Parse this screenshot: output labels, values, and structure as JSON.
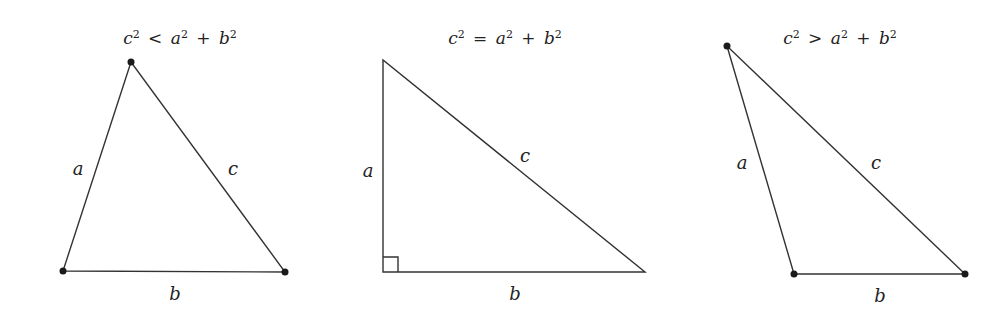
{
  "colors": {
    "stroke": "#333333",
    "text": "#222222",
    "background": "#ffffff"
  },
  "panels": [
    {
      "id": "acute",
      "title": {
        "lhs": "c",
        "op": "<",
        "t1": "a",
        "plus": "+",
        "t2": "b",
        "exp": "2"
      },
      "title_text": "c² < a² + b²",
      "labels": {
        "a": "a",
        "b": "b",
        "c": "c"
      },
      "vertices": [
        [
          63,
          271
        ],
        [
          131,
          62
        ],
        [
          285,
          272
        ]
      ],
      "vertex_dots": true,
      "right_angle_marker": false
    },
    {
      "id": "right",
      "title": {
        "lhs": "c",
        "op": "=",
        "t1": "a",
        "plus": "+",
        "t2": "b",
        "exp": "2"
      },
      "title_text": "c² = a² + b²",
      "labels": {
        "a": "a",
        "b": "b",
        "c": "c"
      },
      "vertices": [
        [
          383,
          272
        ],
        [
          383,
          60
        ],
        [
          645,
          272
        ]
      ],
      "vertex_dots": false,
      "right_angle_marker": true
    },
    {
      "id": "obtuse",
      "title": {
        "lhs": "c",
        "op": ">",
        "t1": "a",
        "plus": "+",
        "t2": "b",
        "exp": "2"
      },
      "title_text": "c² > a² + b²",
      "labels": {
        "a": "a",
        "b": "b",
        "c": "c"
      },
      "vertices": [
        [
          794,
          274
        ],
        [
          727,
          46
        ],
        [
          965,
          274
        ]
      ],
      "vertex_dots": true,
      "right_angle_marker": false
    }
  ]
}
